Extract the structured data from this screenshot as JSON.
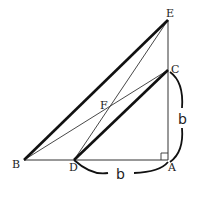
{
  "diagram": {
    "type": "geometry",
    "points": {
      "A": {
        "label": "A",
        "x": 168,
        "y": 160
      },
      "B": {
        "label": "B",
        "x": 24,
        "y": 160
      },
      "C": {
        "label": "C",
        "x": 168,
        "y": 70
      },
      "D": {
        "label": "D",
        "x": 74,
        "y": 160
      },
      "E": {
        "label": "E",
        "x": 168,
        "y": 20
      },
      "F": {
        "label": "F",
        "x": 108,
        "y": 106
      }
    },
    "segments": [
      {
        "from": "B",
        "to": "A",
        "weight": "thin"
      },
      {
        "from": "A",
        "to": "E",
        "weight": "thin"
      },
      {
        "from": "B",
        "to": "E",
        "weight": "thick"
      },
      {
        "from": "D",
        "to": "C",
        "weight": "thick"
      },
      {
        "from": "B",
        "to": "C",
        "weight": "thin"
      },
      {
        "from": "D",
        "to": "E",
        "weight": "thin"
      }
    ],
    "right_angle_at": "A",
    "measurements": [
      {
        "label": "b",
        "segment": "DA"
      },
      {
        "label": "b",
        "segment": "AC"
      }
    ]
  }
}
